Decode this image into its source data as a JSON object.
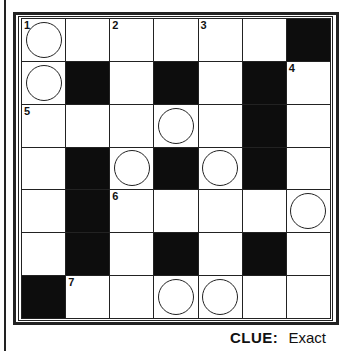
{
  "puzzle": {
    "rows": 7,
    "cols": 7,
    "grid": [
      [
        {
          "type": "white",
          "number": "1",
          "circle": true
        },
        {
          "type": "white"
        },
        {
          "type": "white",
          "number": "2"
        },
        {
          "type": "white"
        },
        {
          "type": "white",
          "number": "3"
        },
        {
          "type": "white"
        },
        {
          "type": "black"
        }
      ],
      [
        {
          "type": "white",
          "circle": true
        },
        {
          "type": "black"
        },
        {
          "type": "white"
        },
        {
          "type": "black"
        },
        {
          "type": "white"
        },
        {
          "type": "black"
        },
        {
          "type": "white",
          "number": "4"
        }
      ],
      [
        {
          "type": "white",
          "number": "5"
        },
        {
          "type": "white"
        },
        {
          "type": "white"
        },
        {
          "type": "white",
          "circle": true
        },
        {
          "type": "white"
        },
        {
          "type": "black"
        },
        {
          "type": "white"
        }
      ],
      [
        {
          "type": "white"
        },
        {
          "type": "black"
        },
        {
          "type": "white",
          "circle": true
        },
        {
          "type": "black"
        },
        {
          "type": "white",
          "circle": true
        },
        {
          "type": "black"
        },
        {
          "type": "white"
        }
      ],
      [
        {
          "type": "white"
        },
        {
          "type": "black"
        },
        {
          "type": "white",
          "number": "6"
        },
        {
          "type": "white"
        },
        {
          "type": "white"
        },
        {
          "type": "white"
        },
        {
          "type": "white",
          "circle": true
        }
      ],
      [
        {
          "type": "white"
        },
        {
          "type": "black"
        },
        {
          "type": "white"
        },
        {
          "type": "black"
        },
        {
          "type": "white"
        },
        {
          "type": "black"
        },
        {
          "type": "white"
        }
      ],
      [
        {
          "type": "black"
        },
        {
          "type": "white",
          "number": "7"
        },
        {
          "type": "white"
        },
        {
          "type": "white",
          "circle": true
        },
        {
          "type": "white",
          "circle": true
        },
        {
          "type": "white"
        },
        {
          "type": "white"
        }
      ]
    ]
  },
  "clue": {
    "label": "CLUE:",
    "text": "Exact"
  },
  "colors": {
    "ink": "#222222",
    "black_cell": "#0d0d0d",
    "paper": "#ffffff"
  }
}
